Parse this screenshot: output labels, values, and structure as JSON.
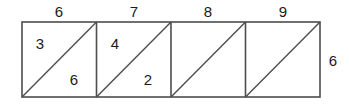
{
  "figure": {
    "background_color": "#ffffff",
    "stroke_color": "#4d4d4d",
    "text_color": "#1a1a1a",
    "geometry": {
      "left": 22,
      "top": 22,
      "square_size": 74.5,
      "count": 4,
      "diagonal_direction": "bottom-left-to-top-right"
    }
  },
  "top_labels": [
    {
      "text": "6",
      "x": 59,
      "y": 11
    },
    {
      "text": "7",
      "x": 134,
      "y": 11
    },
    {
      "text": "8",
      "x": 208,
      "y": 11
    },
    {
      "text": "9",
      "x": 283,
      "y": 11
    }
  ],
  "side_labels": [
    {
      "text": "6",
      "x": 333,
      "y": 60
    }
  ],
  "inner_labels": [
    {
      "text": "3",
      "x": 40,
      "y": 43,
      "square": 1,
      "region": "upper-left-triangle"
    },
    {
      "text": "6",
      "x": 74,
      "y": 79,
      "square": 1,
      "region": "lower-right-triangle"
    },
    {
      "text": "4",
      "x": 115,
      "y": 43,
      "square": 2,
      "region": "upper-left-triangle"
    },
    {
      "text": "2",
      "x": 148,
      "y": 79,
      "square": 2,
      "region": "lower-right-triangle"
    }
  ]
}
